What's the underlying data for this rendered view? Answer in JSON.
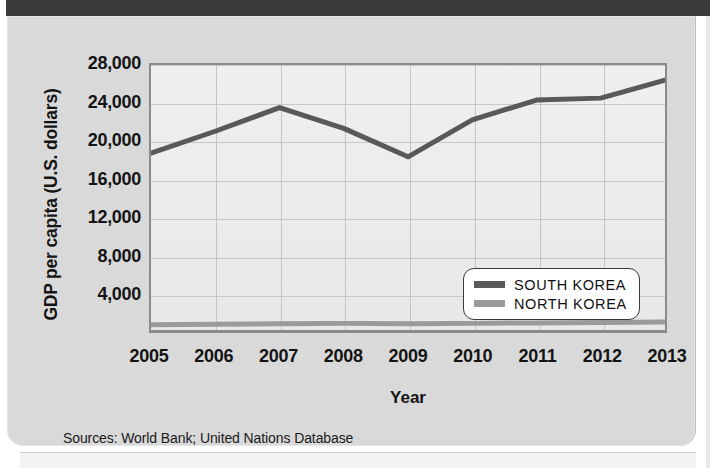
{
  "chart_data": {
    "type": "line",
    "title": "",
    "xlabel": "Year",
    "ylabel": "GDP per capita (U.S. dollars)",
    "x": [
      2005,
      2006,
      2007,
      2008,
      2009,
      2010,
      2011,
      2012,
      2013
    ],
    "xtick_labels": [
      "2005",
      "2006",
      "2007",
      "2008",
      "2009",
      "2010",
      "2011",
      "2012",
      "2013"
    ],
    "ytick_labels": [
      "28,000",
      "24,000",
      "20,000",
      "16,000",
      "12,000",
      "8,000",
      "4,000"
    ],
    "ytick_values": [
      28000,
      24000,
      20000,
      16000,
      12000,
      8000,
      4000
    ],
    "ylim": [
      0,
      28000
    ],
    "xlim": [
      2005,
      2013
    ],
    "grid": true,
    "legend_position": "inside-bottom-right",
    "series": [
      {
        "name": "SOUTH KOREA",
        "color": "#595959",
        "values": [
          18700,
          21000,
          23500,
          21300,
          18300,
          22200,
          24300,
          24500,
          26400
        ]
      },
      {
        "name": "NORTH KOREA",
        "color": "#9a9a9a",
        "values": [
          550,
          600,
          650,
          700,
          650,
          700,
          750,
          800,
          850
        ]
      }
    ]
  },
  "axes": {
    "y_title": "GDP per capita (U.S. dollars)",
    "x_title": "Year"
  },
  "legend": {
    "entries": [
      {
        "label": "SOUTH KOREA",
        "color": "#595959"
      },
      {
        "label": "NORTH KOREA",
        "color": "#9a9a9a"
      }
    ]
  },
  "footer": {
    "sources": "Sources: World Bank; United Nations Database"
  },
  "colors": {
    "card_background": "#d9d9d9",
    "plot_background": "#ececec",
    "plot_border": "#8a8a8a",
    "gridline": "#c4c4c4",
    "top_bar": "#3b3b3b",
    "text": "#141414",
    "south_korea": "#595959",
    "north_korea": "#9a9a9a"
  }
}
